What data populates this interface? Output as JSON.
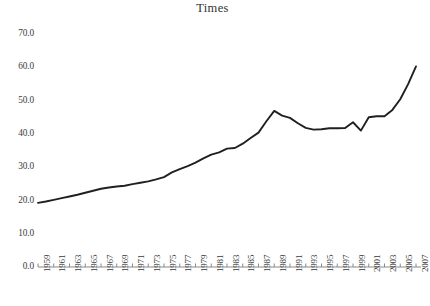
{
  "chart": {
    "title": "Times",
    "axis_label_color": "#3a3a3a",
    "line_color": "#231f20",
    "axis_color": "#8a8a8a"
  },
  "chart_data": {
    "type": "line",
    "title": "Times",
    "xlabel": "",
    "ylabel": "",
    "grid": false,
    "legend": "none",
    "xlim": [
      1959,
      2007
    ],
    "ylim": [
      0.0,
      70.0
    ],
    "ytick_labels": [
      "70.0",
      "60.0",
      "50.0",
      "40.0",
      "30.0",
      "20.0",
      "10.0",
      "0.0"
    ],
    "ytick_values": [
      70.0,
      60.0,
      50.0,
      40.0,
      30.0,
      20.0,
      10.0,
      0.0
    ],
    "xtick_labels": [
      "1959",
      "1961",
      "1963",
      "1965",
      "1967",
      "1969",
      "1971",
      "1973",
      "1975",
      "1977",
      "1979",
      "1981",
      "1983",
      "1985",
      "1987",
      "1989",
      "1991",
      "1993",
      "1995",
      "1997",
      "1999",
      "2001",
      "2003",
      "2005",
      "2007"
    ],
    "xtick_values": [
      1959,
      1961,
      1963,
      1965,
      1967,
      1969,
      1971,
      1973,
      1975,
      1977,
      1979,
      1981,
      1983,
      1985,
      1987,
      1989,
      1991,
      1993,
      1995,
      1997,
      1999,
      2001,
      2003,
      2005,
      2007
    ],
    "x": [
      1959,
      1960,
      1961,
      1962,
      1963,
      1964,
      1965,
      1966,
      1967,
      1968,
      1969,
      1970,
      1971,
      1972,
      1973,
      1974,
      1975,
      1976,
      1977,
      1978,
      1979,
      1980,
      1981,
      1982,
      1983,
      1984,
      1985,
      1986,
      1987,
      1988,
      1989,
      1990,
      1991,
      1992,
      1993,
      1994,
      1995,
      1996,
      1997,
      1998,
      1999,
      2000,
      2001,
      2002,
      2003,
      2004,
      2005,
      2006,
      2007
    ],
    "values": [
      19.2,
      19.6,
      20.1,
      20.6,
      21.1,
      21.6,
      22.2,
      22.8,
      23.4,
      23.8,
      24.1,
      24.3,
      24.8,
      25.2,
      25.6,
      26.2,
      26.9,
      28.3,
      29.3,
      30.2,
      31.2,
      32.5,
      33.6,
      34.3,
      35.4,
      35.6,
      36.9,
      38.6,
      40.2,
      43.6,
      46.7,
      45.3,
      44.6,
      43.0,
      41.6,
      41.1,
      41.2,
      41.5,
      41.5,
      41.6,
      43.3,
      40.8,
      44.8,
      45.1,
      45.1,
      47.0,
      50.2,
      54.7,
      60.0
    ]
  }
}
